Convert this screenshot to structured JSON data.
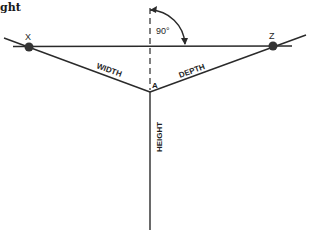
{
  "title_fragment": "ght",
  "angle_label": "90°",
  "points": {
    "x": {
      "label": "X"
    },
    "z": {
      "label": "Z"
    },
    "a": {
      "label": "A"
    }
  },
  "axes": {
    "width": "WIDTH",
    "depth": "DEPTH",
    "height": "HEIGHT"
  },
  "colors": {
    "line": "#2a2a2a",
    "dot": "#333333",
    "background": "#ffffff"
  }
}
